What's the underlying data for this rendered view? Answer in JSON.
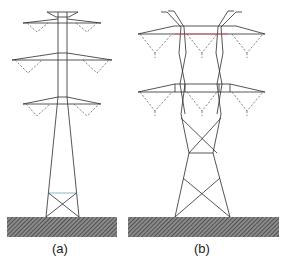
{
  "figure": {
    "panels": [
      {
        "id": "a",
        "label": "(a)",
        "description": "Single-mast transmission tower with three double cross-arms and insulator V-strings"
      },
      {
        "id": "b",
        "label": "(b)",
        "description": "Waisted double-column transmission tower with two triple cross-arms"
      }
    ],
    "colors": {
      "structure": "#2b2b2b",
      "crossarm_highlight": "#d9535f",
      "bracing_highlight": "#6fa6b0",
      "insulator": "#555555",
      "ground_fill": "#6a6a6a"
    }
  }
}
